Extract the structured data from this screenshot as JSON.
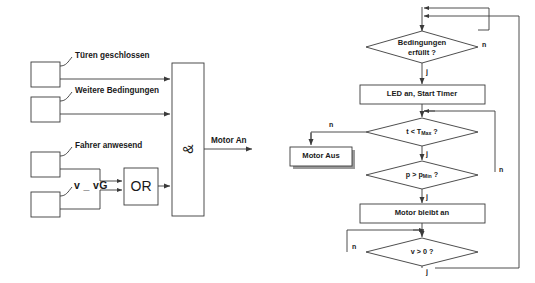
{
  "diagram": {
    "line_color": "#3a3a3a",
    "text_color": "#1a1a1a",
    "fill_color": "#ffffff",
    "shadow_color": "#9a9a9a"
  },
  "logic": {
    "inputs": [
      {
        "id": "tueren",
        "label": "Türen geschlossen"
      },
      {
        "id": "weitere",
        "label": "Weitere Bedingungen"
      },
      {
        "id": "fahrer",
        "label": "Fahrer anwesend"
      },
      {
        "id": "v_vg",
        "label": "v _ vG"
      }
    ],
    "or_gate": {
      "label": "OR"
    },
    "and_gate": {
      "label": "&"
    },
    "output": {
      "label": "Motor An"
    }
  },
  "flow": {
    "decisions": [
      {
        "id": "bedingungen",
        "line1": "Bedingungen",
        "line2": "erfüllt ?",
        "yes": "j",
        "no": "n"
      },
      {
        "id": "t_tmax",
        "expr_pre": "t < T",
        "expr_sub": "Max",
        "expr_post": " ?",
        "yes": "j",
        "no": "n"
      },
      {
        "id": "p_pmin",
        "expr_pre": "p > p",
        "expr_sub": "Min",
        "expr_post": " ?",
        "yes": "j",
        "no": "n"
      },
      {
        "id": "v_gt_0",
        "expr_pre": "v > 0 ?",
        "expr_sub": "",
        "expr_post": "",
        "yes": "j",
        "no": "n"
      }
    ],
    "processes": [
      {
        "id": "led_timer",
        "label": "LED an, Start Timer"
      },
      {
        "id": "motor_aus",
        "label": "Motor Aus"
      },
      {
        "id": "motor_bleibt_an",
        "label": "Motor bleibt an"
      }
    ]
  }
}
